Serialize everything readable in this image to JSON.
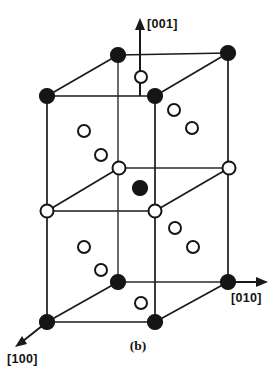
{
  "figure": {
    "panel_label": "(b)",
    "caption_position": "bottom-center",
    "background_color": "#ffffff",
    "line_color": "#1a1a1a",
    "filled_atom_color": "#151515",
    "open_atom_fill": "#ffffff",
    "open_atom_stroke": "#151515"
  },
  "axes": {
    "vertical": {
      "label": "[001]",
      "direction": "up",
      "arrow": "up-arrow-icon",
      "tail": {
        "x": 140,
        "y": 96
      },
      "head": {
        "x": 140,
        "y": 22
      },
      "label_position": {
        "x": 146,
        "y": 28
      }
    },
    "right": {
      "label": "[010]",
      "direction": "right",
      "arrow": "right-arrow-icon",
      "tail": {
        "x": 228,
        "y": 282
      },
      "head": {
        "x": 266,
        "y": 282
      },
      "label_position": {
        "x": 231,
        "y": 300
      }
    },
    "front_left": {
      "label": "[100]",
      "direction": "down-left",
      "arrow": "down-left-arrow-icon",
      "tail": {
        "x": 47,
        "y": 322
      },
      "head": {
        "x": 18,
        "y": 345
      },
      "label_position": {
        "x": 8,
        "y": 362
      }
    }
  },
  "cell": {
    "type": "tetragonal-oblique-projection",
    "description": "Doubled tetragonal unit cell drawn in oblique projection with three stacked atomic layers",
    "vertices": {
      "top_back_left": {
        "x": 118,
        "y": 55
      },
      "top_back_right": {
        "x": 228,
        "y": 53
      },
      "top_front_left": {
        "x": 47,
        "y": 96
      },
      "top_front_right": {
        "x": 155,
        "y": 96
      },
      "mid_back_left": {
        "x": 119,
        "y": 168
      },
      "mid_back_right": {
        "x": 229,
        "y": 168
      },
      "mid_front_left": {
        "x": 47,
        "y": 211
      },
      "mid_front_right": {
        "x": 155,
        "y": 211
      },
      "bot_back_left": {
        "x": 118,
        "y": 282
      },
      "bot_back_right": {
        "x": 228,
        "y": 282
      },
      "bot_front_left": {
        "x": 47,
        "y": 322
      },
      "bot_front_right": {
        "x": 155,
        "y": 322
      }
    }
  },
  "atoms": {
    "legend": {
      "filled": "filled-circle-atom",
      "open": "open-circle-atom"
    },
    "filled": [
      {
        "name": "atom-top-back-left",
        "x": 118,
        "y": 55,
        "r": 7.5
      },
      {
        "name": "atom-top-back-right",
        "x": 228,
        "y": 53,
        "r": 7.5
      },
      {
        "name": "atom-top-front-left",
        "x": 47,
        "y": 96,
        "r": 7.5
      },
      {
        "name": "atom-top-front-right",
        "x": 155,
        "y": 96,
        "r": 7.5
      },
      {
        "name": "atom-body-center",
        "x": 140,
        "y": 188,
        "r": 7.5
      },
      {
        "name": "atom-bot-back-left",
        "x": 118,
        "y": 282,
        "r": 7.5
      },
      {
        "name": "atom-bot-back-right",
        "x": 228,
        "y": 282,
        "r": 7.5
      },
      {
        "name": "atom-bot-front-left",
        "x": 47,
        "y": 322,
        "r": 7.5
      },
      {
        "name": "atom-bot-front-right",
        "x": 155,
        "y": 322,
        "r": 7.5
      }
    ],
    "open": [
      {
        "name": "atom-top-face-center",
        "x": 141,
        "y": 77,
        "r": 6.0
      },
      {
        "name": "atom-upper-left-face-a",
        "x": 84,
        "y": 131,
        "r": 6.0
      },
      {
        "name": "atom-upper-left-face-b",
        "x": 101,
        "y": 155,
        "r": 6.0
      },
      {
        "name": "atom-upper-right-face-a",
        "x": 174,
        "y": 110,
        "r": 6.0
      },
      {
        "name": "atom-upper-right-face-b",
        "x": 192,
        "y": 128,
        "r": 6.0
      },
      {
        "name": "atom-mid-back-left",
        "x": 119,
        "y": 168,
        "r": 6.5
      },
      {
        "name": "atom-mid-back-right",
        "x": 229,
        "y": 168,
        "r": 6.5
      },
      {
        "name": "atom-mid-front-left",
        "x": 47,
        "y": 211,
        "r": 6.5
      },
      {
        "name": "atom-mid-front-right",
        "x": 155,
        "y": 211,
        "r": 6.5
      },
      {
        "name": "atom-lower-right-face-a",
        "x": 175,
        "y": 228,
        "r": 6.0
      },
      {
        "name": "atom-lower-right-face-b",
        "x": 193,
        "y": 247,
        "r": 6.0
      },
      {
        "name": "atom-lower-left-face-a",
        "x": 84,
        "y": 247,
        "r": 6.0
      },
      {
        "name": "atom-lower-left-face-b",
        "x": 101,
        "y": 270,
        "r": 6.0
      },
      {
        "name": "atom-bottom-face-center",
        "x": 141,
        "y": 303,
        "r": 6.0
      }
    ]
  },
  "chart_data": {
    "type": "diagram",
    "title": "(b)",
    "subtitle": "Tetragonal unit cell in oblique projection",
    "annotations": [
      "[001]",
      "[010]",
      "[100]",
      "(b)"
    ],
    "series": [
      {
        "name": "filled-circle-atom",
        "count": 9
      },
      {
        "name": "open-circle-atom",
        "count": 14
      }
    ]
  }
}
